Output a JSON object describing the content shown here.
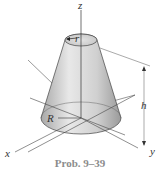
{
  "figure": {
    "caption": "Prob. 9–39",
    "labels": {
      "z": "z",
      "r": "r",
      "R": "R",
      "h": "h",
      "x": "x",
      "y": "y"
    },
    "colors": {
      "cone_light": "#e6e6e6",
      "cone_dark": "#9a9a9a",
      "top_face": "#d4d4d4",
      "caption": "#8c8c8c",
      "lines": "#555555"
    }
  }
}
